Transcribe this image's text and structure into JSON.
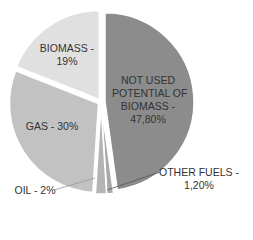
{
  "chart_data": {
    "type": "pie",
    "title": "",
    "start_angle_deg": 0,
    "direction": "clockwise",
    "slices": [
      {
        "label": "NOT USED POTENTIAL OF BIOMASS",
        "value": 47.8,
        "display": "NOT USED\nPOTENTIAL OF\nBIOMASS -\n47,80%",
        "color": "#8c8c8c"
      },
      {
        "label": "OTHER FUELS",
        "value": 1.2,
        "display": "OTHER FUELS -\n1,20%",
        "color": "#a9a9a9"
      },
      {
        "label": "OIL",
        "value": 2,
        "display": "OIL - 2%",
        "color": "#b4b4b4"
      },
      {
        "label": "GAS",
        "value": 30,
        "display": "GAS - 30%",
        "color": "#c2c2c2"
      },
      {
        "label": "BIOMASS",
        "value": 19,
        "display": "BIOMASS -\n19%",
        "color": "#e0e0e0"
      }
    ],
    "legend": "none",
    "data_labels": true
  },
  "labels": {
    "not_used": "NOT USED\nPOTENTIAL OF\nBIOMASS -\n47,80%",
    "other_fuels": "OTHER FUELS -\n1,20%",
    "oil": "OIL - 2%",
    "gas": "GAS - 30%",
    "biomass": "BIOMASS -\n19%"
  }
}
